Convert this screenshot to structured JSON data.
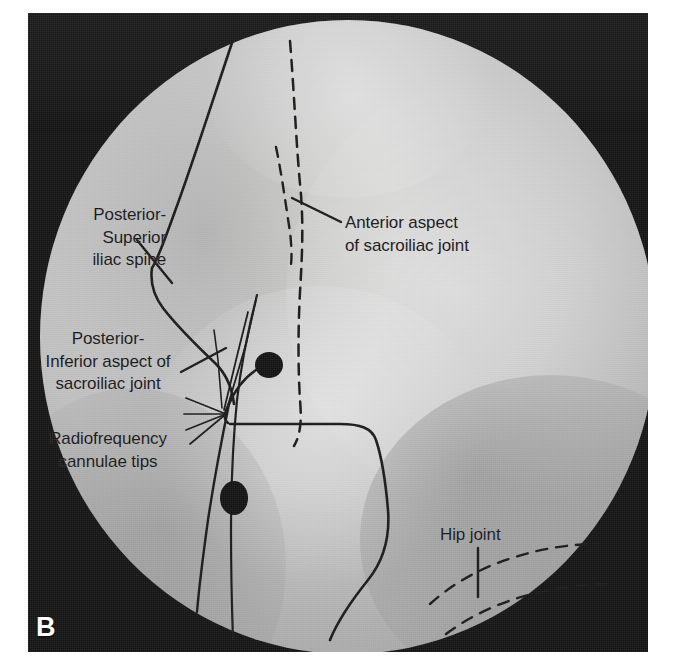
{
  "figure": {
    "panel_letter": "B",
    "modality": "fluoroscopic-radiograph",
    "view": "sacroiliac joint oblique fluoroscopy with radiofrequency cannulae in situ",
    "background_color": "#161616",
    "field_color": "#d2d2d2",
    "annotation_color": "#171717",
    "panel_letter_color": "#ffffff"
  },
  "labels": {
    "psis": {
      "lines": [
        "Posterior-",
        "Superior",
        "iliac spine"
      ],
      "align": "right"
    },
    "posterior_inferior": {
      "lines": [
        "Posterior-",
        "Inferior aspect of",
        "sacroiliac joint"
      ],
      "align": "center"
    },
    "radiofrequency": {
      "lines": [
        "Radiofrequency",
        "cannulae tips"
      ],
      "align": "center"
    },
    "anterior": {
      "lines": [
        "Anterior aspect",
        "of sacroiliac joint"
      ],
      "align": "left"
    },
    "hip": {
      "lines": [
        "Hip joint"
      ],
      "align": "left"
    }
  },
  "markers": {
    "electrode_hub_upper": "radiofrequency-electrode-hub",
    "electrode_hub_lower": "radiofrequency-electrode-hub",
    "cannulae_count": 4
  }
}
